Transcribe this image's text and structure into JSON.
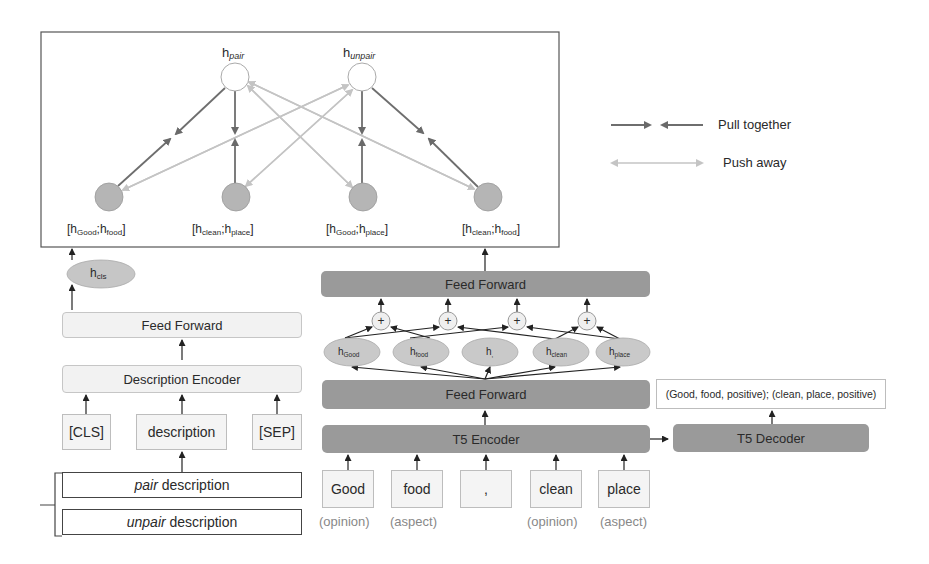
{
  "contrastive": {
    "top_nodes": [
      {
        "base": "h",
        "sub": "pair"
      },
      {
        "base": "h",
        "sub": "unpair"
      }
    ],
    "bottom_nodes": [
      {
        "a": "Good",
        "b": "food"
      },
      {
        "a": "clean",
        "b": "place"
      },
      {
        "a": "Good",
        "b": "place"
      },
      {
        "a": "clean",
        "b": "food"
      }
    ]
  },
  "legend": {
    "pull_label": "Pull together",
    "push_label": "Push away"
  },
  "left_branch": {
    "hcls": {
      "base": "h",
      "sub": "cls"
    },
    "feed_forward": "Feed Forward",
    "description_encoder": "Description Encoder",
    "tokens": [
      "[CLS]",
      "description",
      "[SEP]"
    ],
    "pair_description": {
      "italic": "pair",
      "rest": " description"
    },
    "unpair_description": {
      "italic": "unpair",
      "rest": " description"
    }
  },
  "right_branch": {
    "feed_forward_top": "Feed Forward",
    "feed_forward_bottom": "Feed Forward",
    "t5_encoder": "T5 Encoder",
    "t5_decoder": "T5 Decoder",
    "output_text": "(Good, food, positive); (clean, place, positive)",
    "plus_symbol": "+",
    "hidden_states": [
      {
        "base": "h",
        "sub": "Good"
      },
      {
        "base": "h",
        "sub": "food"
      },
      {
        "base": "h",
        "sub": ","
      },
      {
        "base": "h",
        "sub": "clean"
      },
      {
        "base": "h",
        "sub": "place"
      }
    ],
    "input_tokens": [
      {
        "text": "Good",
        "role": "(opinion)"
      },
      {
        "text": "food",
        "role": "(aspect)"
      },
      {
        "text": ",",
        "role": ""
      },
      {
        "text": "clean",
        "role": "(opinion)"
      },
      {
        "text": "place",
        "role": "(aspect)"
      }
    ]
  },
  "colors": {
    "pull": "#6e6e6e",
    "push": "#c4c4c4",
    "node_fill": "#b5b5b5",
    "dark_box": "#9a9a9a"
  }
}
